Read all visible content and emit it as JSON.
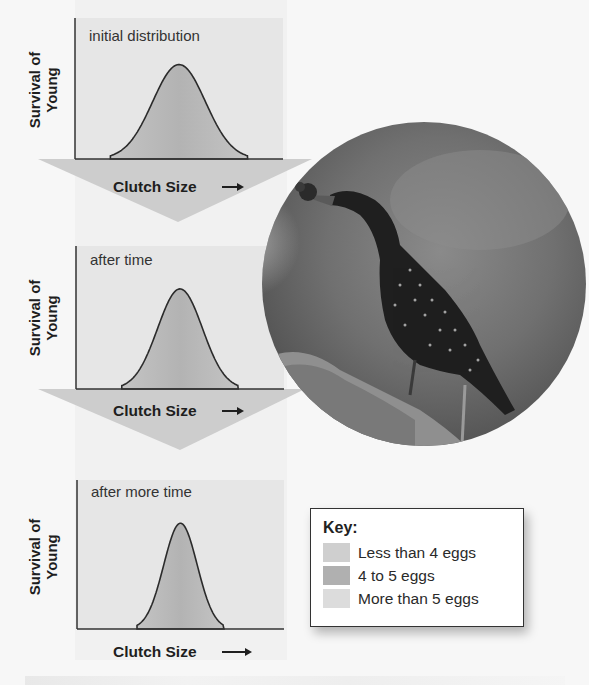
{
  "figure": {
    "background": "#f7f7f7",
    "colors": {
      "plot_bg": "#e6e6e6",
      "curve_fill": "#bdbdbd",
      "curve_fill_center": "#b2b2b2",
      "curve_stroke": "#2b2b2b",
      "axis": "#333333",
      "arrow_band": "#cdcdcd",
      "text": "#1e1e1e"
    }
  },
  "chart_data": [
    {
      "type": "area",
      "title": "initial distribution",
      "xlabel": "Clutch Size",
      "xlabel_arrow": "→",
      "ylabel": "Survival of Young",
      "ylabel_lines": [
        "Survival of",
        "Young"
      ],
      "grid": false,
      "legend_position": "none",
      "curve": {
        "shape": "bell",
        "center": 0.5,
        "width": 0.66,
        "peak": 0.67
      },
      "x": [
        0,
        0.2,
        0.32,
        0.5,
        0.68,
        0.8,
        1
      ],
      "y": [
        0,
        0,
        0.35,
        0.67,
        0.35,
        0,
        0
      ]
    },
    {
      "type": "area",
      "title": "after time",
      "xlabel": "Clutch Size",
      "xlabel_arrow": "→",
      "ylabel": "Survival of Young",
      "ylabel_lines": [
        "Survival of",
        "Young"
      ],
      "grid": false,
      "legend_position": "none",
      "curve": {
        "shape": "bell",
        "center": 0.5,
        "width": 0.56,
        "peak": 0.7
      },
      "x": [
        0,
        0.22,
        0.37,
        0.5,
        0.63,
        0.78,
        1
      ],
      "y": [
        0,
        0,
        0.37,
        0.7,
        0.37,
        0,
        0
      ]
    },
    {
      "type": "area",
      "title": "after more time",
      "xlabel": "Clutch Size",
      "xlabel_arrow": "→",
      "ylabel": "Survival of Young",
      "ylabel_lines": [
        "Survival of",
        "Young"
      ],
      "grid": false,
      "legend_position": "none",
      "curve": {
        "shape": "bell",
        "center": 0.5,
        "width": 0.42,
        "peak": 0.71
      },
      "x": [
        0,
        0.3,
        0.41,
        0.5,
        0.59,
        0.7,
        1
      ],
      "y": [
        0,
        0,
        0.38,
        0.71,
        0.38,
        0,
        0
      ]
    }
  ],
  "key": {
    "title": "Key:",
    "items": [
      {
        "label": "Less than 4 eggs",
        "color": "#cfcfcf"
      },
      {
        "label": "4 to 5 eggs",
        "color": "#b0b0b0"
      },
      {
        "label": "More than 5 eggs",
        "color": "#dcdcdc"
      }
    ]
  },
  "photo": {
    "subject": "starling-with-nesting-material",
    "shape": "circle"
  }
}
